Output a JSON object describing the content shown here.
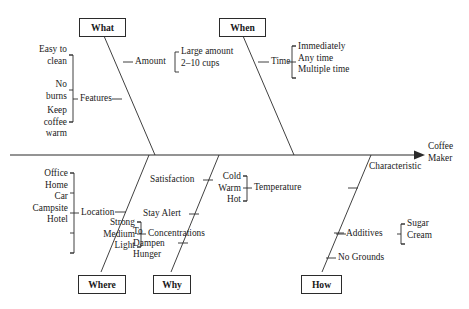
{
  "diagram": {
    "type": "fishbone-ishikawa",
    "effect_label": "Coffee\nMaker",
    "categories": {
      "what": "What",
      "when": "When",
      "where": "Where",
      "why": "Why",
      "how": "How"
    },
    "branches": {
      "what": {
        "amount": "Amount",
        "amount_items": "Large amount\n2–10 cups",
        "features": "Features",
        "features_items": "Easy to\nclean\n\nNo\nburns\n\nKeep\ncoffee\nwarm",
        "features_item_1": "Easy to\nclean",
        "features_item_2": "No\nburns",
        "features_item_3": "Keep\ncoffee\nwarm"
      },
      "when": {
        "time": "Time",
        "time_items": "Immediately\nAny time\nMultiple time",
        "time_item_1": "Immediately",
        "time_item_2": "Any time",
        "time_item_3": "Multiple time"
      },
      "where": {
        "location": "Location",
        "location_items": "Office\nHome\nCar\nCampsite\nHotel"
      },
      "why": {
        "satisfaction": "Satisfaction",
        "stay_alert": "Stay Alert",
        "dampen_hunger": "To\nDampen\nHunger"
      },
      "how": {
        "temperature": "Temperature",
        "temperature_items": "Cold\nWarm\nHot",
        "concentrations": "Concentrations",
        "concentrations_items": "Strong\nMedium\nLight",
        "additives": "Additives",
        "additives_items": "Sugar\nCream",
        "no_grounds": "No Grounds",
        "characteristic": "Characteristic"
      }
    },
    "colors": {
      "line": "#2b2b2b",
      "text": "#1a1a1a",
      "background": "#ffffff"
    }
  }
}
